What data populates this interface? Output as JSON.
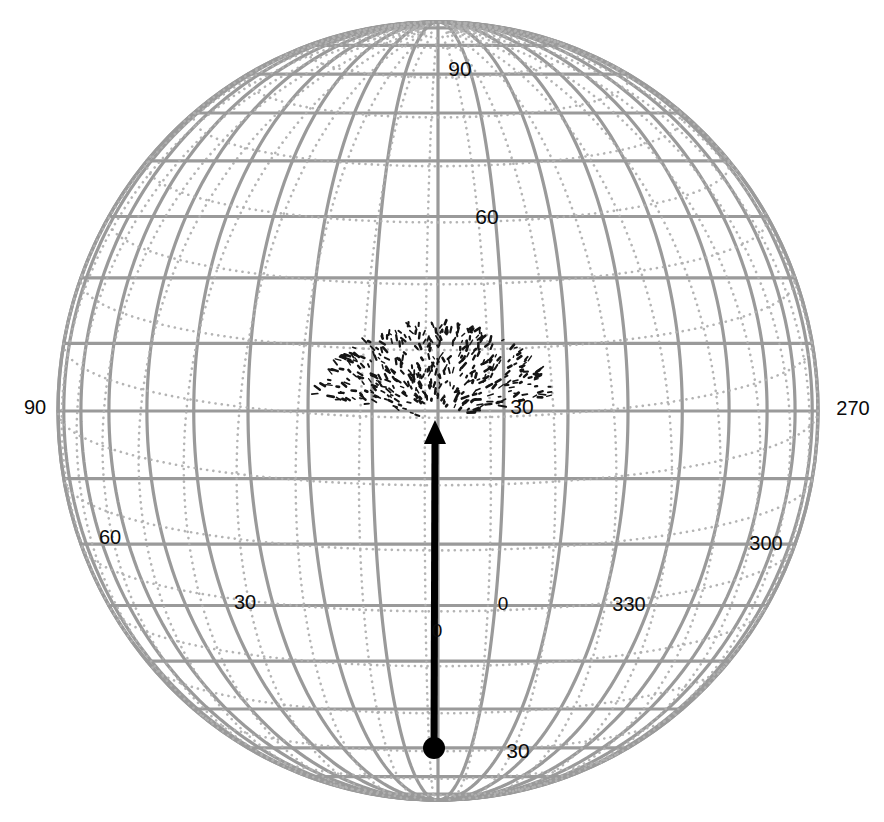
{
  "figure": {
    "type": "orthographic-globe-projection",
    "background_color": "#ffffff",
    "grid_color": "#9a9a9a",
    "dotted_grid_color": "#b0b0b0",
    "vector_color": "#000000",
    "label_color": "#0a0a0a",
    "globe": {
      "center_x": 438,
      "center_y": 411,
      "radius_x": 380,
      "radius_y": 389,
      "view_center_latitude": 0,
      "view_center_longitude": 0,
      "grid_spacing_degrees": 10,
      "label_spacing_degrees": 30
    }
  },
  "labels": {
    "latitude": [
      {
        "text": "90",
        "x": 460,
        "y": 68
      },
      {
        "text": "60",
        "x": 487,
        "y": 216
      },
      {
        "text": "30",
        "x": 522,
        "y": 406
      },
      {
        "text": "0",
        "x": 503,
        "y": 603
      },
      {
        "text": "30",
        "x": 518,
        "y": 750
      }
    ],
    "longitude": [
      {
        "text": "90",
        "x": 35,
        "y": 407
      },
      {
        "text": "270",
        "x": 853,
        "y": 408
      },
      {
        "text": "60",
        "x": 110,
        "y": 537
      },
      {
        "text": "300",
        "x": 766,
        "y": 543
      },
      {
        "text": "30",
        "x": 245,
        "y": 602
      },
      {
        "text": "330",
        "x": 629,
        "y": 604
      }
    ],
    "origin": [
      {
        "text": "0",
        "x": 437,
        "y": 630
      }
    ]
  },
  "overlay_vector": {
    "name": "field-line-vector",
    "tail_x": 434,
    "tail_y": 748,
    "head_x": 435,
    "head_y": 428,
    "tail_marker": "filled-circle",
    "head_marker": "arrowhead",
    "line_width_px": 7,
    "color": "#000000",
    "fan_spray": {
      "center_x": 435,
      "center_y": 420,
      "half_width_px": 108,
      "height_px": 55,
      "description": "dotted fan / spray of short dark strokes above arrowhead"
    }
  },
  "chart_data": {
    "type": "scatter",
    "title": "",
    "xlabel": "",
    "ylabel": "",
    "projection": "orthographic",
    "latitude_ticks": [
      90,
      60,
      30,
      0,
      -30
    ],
    "latitude_tick_labels": [
      "90",
      "60",
      "30",
      "0",
      "30"
    ],
    "longitude_ticks": [
      90,
      60,
      30,
      0,
      330,
      300,
      270
    ],
    "longitude_tick_labels": [
      "90",
      "60",
      "30",
      "0",
      "330",
      "300",
      "270"
    ],
    "grid": true,
    "legend": "none",
    "series": [
      {
        "name": "geographic-graticule",
        "style": "solid",
        "color": "#9a9a9a",
        "spacing_degrees": 10
      },
      {
        "name": "secondary-dotted-graticule",
        "style": "dotted",
        "color": "#b0b0b0",
        "spacing_degrees": 10,
        "tilt_degrees": 11
      },
      {
        "name": "vector-overlay",
        "style": "arrow",
        "color": "#000000",
        "start_lat": -28,
        "start_lon": 0,
        "end_lat": 13,
        "end_lon": 0
      }
    ]
  }
}
